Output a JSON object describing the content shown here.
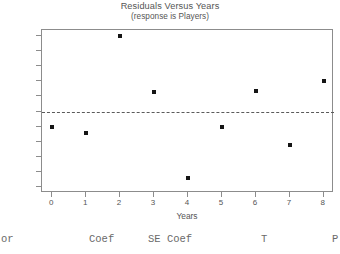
{
  "chart_data": {
    "type": "scatter",
    "title": "Residuals Versus Years",
    "subtitle": "(response is Players)",
    "xlabel": "Years",
    "ylabel": "Residual",
    "x": [
      0,
      1,
      2,
      3,
      4,
      5,
      6,
      7,
      8
    ],
    "values": [
      -1.0,
      -1.45,
      5.0,
      1.27,
      -4.4,
      -1.0,
      1.35,
      -2.25,
      2.0
    ],
    "xticks": [
      "0",
      "1",
      "2",
      "3",
      "4",
      "5",
      "6",
      "7",
      "8"
    ],
    "yticks": [
      "5",
      "4",
      "3",
      "2",
      "1",
      "0",
      "-1",
      "-2",
      "-3",
      "-4",
      "-5"
    ],
    "xlim": [
      -0.3,
      8.3
    ],
    "ylim": [
      -5.4,
      5.4
    ],
    "grid": false,
    "legend": null,
    "reference_line": {
      "orientation": "horizontal",
      "value": 0,
      "style": "dashed"
    },
    "marker": {
      "shape": "square",
      "color": "#151515"
    },
    "frame_color": "#8c8c8c"
  },
  "output_table": {
    "columns": [
      {
        "label": "or",
        "x": 1
      },
      {
        "label": "Coef",
        "x": 89
      },
      {
        "label": "SE Coef",
        "x": 148
      },
      {
        "label": "T",
        "x": 261
      },
      {
        "label": "P",
        "x": 332
      }
    ]
  }
}
